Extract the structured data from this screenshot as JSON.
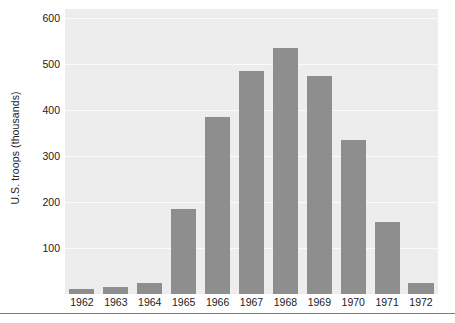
{
  "chart_data": {
    "type": "bar",
    "title": "",
    "subtitle": "",
    "xlabel": "",
    "ylabel": "U.S. troops (thousands)",
    "categories": [
      "1962",
      "1963",
      "1964",
      "1965",
      "1966",
      "1967",
      "1968",
      "1969",
      "1970",
      "1971",
      "1972"
    ],
    "values": [
      11,
      16,
      23,
      184,
      385,
      486,
      536,
      475,
      335,
      157,
      24
    ],
    "ylim": [
      0,
      620
    ],
    "yticks": [
      100,
      200,
      300,
      400,
      500,
      600
    ],
    "ytick_labels": [
      "100",
      "200",
      "300",
      "400",
      "500",
      "600"
    ],
    "grid": true,
    "grid_axis": "y",
    "legend": false,
    "legend_position": "none",
    "bar_color": "#8e8e8e",
    "plot_background": "#ededed",
    "gridline_color": "#fbfbfb",
    "figure_background": "#ffffff",
    "text_color": "#222222",
    "rule_color": "#7d7d7d"
  }
}
